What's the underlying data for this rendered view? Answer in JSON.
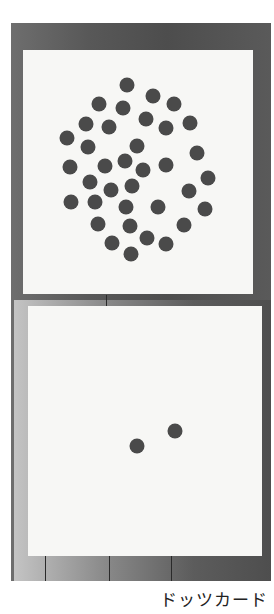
{
  "caption": "ドッツカード",
  "colors": {
    "dot": "#4a4a4a",
    "card": "#f7f7f5",
    "frame": "#555555"
  },
  "cards": [
    {
      "name": "many-dots-card",
      "dot_count": 36,
      "box": {
        "left": 23,
        "top": 50,
        "width": 230,
        "height": 244
      },
      "dots": [
        [
          127,
          85
        ],
        [
          153,
          96
        ],
        [
          99,
          104
        ],
        [
          123,
          108
        ],
        [
          174,
          104
        ],
        [
          86,
          124
        ],
        [
          146,
          119
        ],
        [
          109,
          127
        ],
        [
          166,
          128
        ],
        [
          190,
          123
        ],
        [
          67,
          138
        ],
        [
          88,
          147
        ],
        [
          137,
          146
        ],
        [
          197,
          153
        ],
        [
          70,
          167
        ],
        [
          105,
          166
        ],
        [
          125,
          161
        ],
        [
          143,
          170
        ],
        [
          166,
          165
        ],
        [
          208,
          178
        ],
        [
          90,
          182
        ],
        [
          111,
          190
        ],
        [
          132,
          186
        ],
        [
          189,
          191
        ],
        [
          71,
          202
        ],
        [
          95,
          202
        ],
        [
          126,
          207
        ],
        [
          158,
          207
        ],
        [
          205,
          209
        ],
        [
          98,
          224
        ],
        [
          130,
          226
        ],
        [
          184,
          225
        ],
        [
          112,
          243
        ],
        [
          147,
          238
        ],
        [
          166,
          244
        ],
        [
          131,
          254
        ]
      ]
    },
    {
      "name": "two-dots-card",
      "dot_count": 2,
      "box": {
        "left": 28,
        "top": 306,
        "width": 234,
        "height": 250
      },
      "dots": [
        [
          137,
          446
        ],
        [
          175,
          431
        ]
      ]
    }
  ]
}
